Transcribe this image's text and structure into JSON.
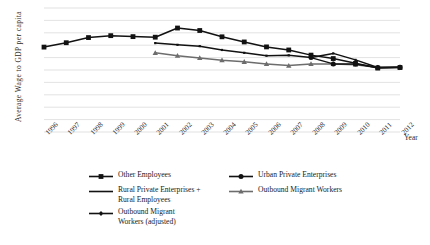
{
  "axes": {
    "y_title": "Average Wage to  GDP per capita",
    "x_title": "Year"
  },
  "legend": {
    "left": [
      {
        "label": "Other Employees",
        "marker": "square-marker",
        "color": "#121212"
      },
      {
        "label": "Rural Private Enterprises +\nRural Employees",
        "marker": "line-marker",
        "color": "#121212"
      },
      {
        "label": "Outbound Migrant\nWorkers (adjusted)",
        "marker": "diamond-marker",
        "color": "#121212"
      }
    ],
    "right": [
      {
        "label": "Urban Private Enterprises",
        "marker": "circle-marker",
        "color": "#121212"
      },
      {
        "label": "Outbound Migrant Workers",
        "marker": "triangle-marker",
        "color": "#6d6d6d"
      }
    ]
  },
  "chart_data": {
    "type": "line",
    "title": "",
    "xlabel": "Year",
    "ylabel": "Average Wage to  GDP per capita",
    "grid": true,
    "gridlines": 11,
    "legend_position": "bottom",
    "categories": [
      1996,
      1997,
      1998,
      1999,
      2000,
      2001,
      2002,
      2003,
      2004,
      2005,
      2006,
      2007,
      2008,
      2009,
      2010,
      2011,
      2012
    ],
    "tick_labels": [
      "1996",
      "1997",
      "1998",
      "1999",
      "2000",
      "2001",
      "2002",
      "2003",
      "2004",
      "2005",
      "2006",
      "2007",
      "2008",
      "2009",
      "2010",
      "2011",
      "2012"
    ],
    "ylim": [
      0.4,
      1.05
    ],
    "series": [
      {
        "name": "Other Employees",
        "marker": "square",
        "color": "#121212",
        "x": [
          1996,
          1997,
          1998,
          1999,
          2000,
          2001,
          2002,
          2003,
          2004,
          2005,
          2006,
          2007,
          2008,
          2009,
          2010,
          2011,
          2012
        ],
        "values": [
          0.845,
          0.868,
          0.895,
          0.905,
          0.9,
          0.897,
          0.945,
          0.932,
          0.899,
          0.872,
          0.846,
          0.83,
          0.803,
          0.785,
          0.76,
          0.735,
          0.738
        ]
      },
      {
        "name": "Rural Private Enterprises + Rural Employees",
        "marker": "line",
        "color": "#121212",
        "x": [
          2001,
          2002,
          2003,
          2004,
          2005,
          2006,
          2007,
          2008,
          2009,
          2010,
          2011,
          2012
        ],
        "values": [
          0.866,
          0.857,
          0.85,
          0.83,
          0.815,
          0.8,
          0.802,
          0.79,
          0.812,
          0.778,
          0.738,
          0.74
        ]
      },
      {
        "name": "Outbound Migrant Workers",
        "marker": "triangle",
        "color": "#6d6d6d",
        "x": [
          2001,
          2002,
          2003,
          2004,
          2005,
          2006,
          2007,
          2008,
          2009,
          2010,
          2011,
          2012
        ],
        "values": [
          0.815,
          0.8,
          0.788,
          0.776,
          0.768,
          0.757,
          0.748,
          0.757,
          0.757,
          0.753,
          0.738,
          0.74
        ]
      },
      {
        "name": "Urban Private Enterprises",
        "marker": "circle",
        "color": "#121212",
        "x": [
          2008,
          2009,
          2010,
          2011,
          2012
        ],
        "values": [
          0.79,
          0.757,
          0.757,
          0.738,
          0.74
        ]
      }
    ]
  }
}
